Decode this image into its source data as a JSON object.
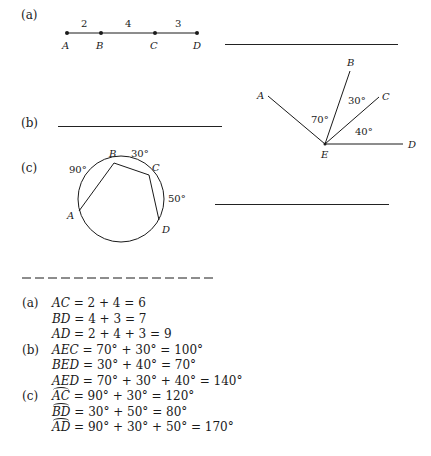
{
  "problems": {
    "a": {
      "label": "(a)",
      "points": [
        "A",
        "B",
        "C",
        "D"
      ],
      "segments": [
        "2",
        "4",
        "3"
      ]
    },
    "b": {
      "label": "(b)",
      "points": [
        "A",
        "B",
        "C",
        "D",
        "E"
      ],
      "angles": [
        "70°",
        "30°",
        "40°"
      ]
    },
    "c": {
      "label": "(c)",
      "points": [
        "A",
        "B",
        "C",
        "D"
      ],
      "arcs": [
        "90°",
        "30°",
        "50°"
      ]
    }
  },
  "answers": {
    "a": {
      "label": "(a)",
      "lines": [
        {
          "lhs": "AC",
          "rhs": " = 2 + 4 = 6"
        },
        {
          "lhs": "BD",
          "rhs": " = 4 + 3 = 7"
        },
        {
          "lhs": "AD",
          "rhs": " = 2 + 4 + 3 = 9"
        }
      ]
    },
    "b": {
      "label": "(b)",
      "lines": [
        {
          "lhs": "AEC",
          "rhs": " = 70° + 30° = 100°"
        },
        {
          "lhs": "BED",
          "rhs": " = 30° + 40° = 70°"
        },
        {
          "lhs": "AED",
          "rhs": " = 70° + 30° + 40° = 140°"
        }
      ]
    },
    "c": {
      "label": "(c)",
      "lines": [
        {
          "lhs": "AC",
          "rhs": " = 90° + 30° = 120°"
        },
        {
          "lhs": "BD",
          "rhs": " = 30° + 50° = 80°"
        },
        {
          "lhs": "AD",
          "rhs": " = 90° + 30° + 50° = 170°"
        }
      ]
    }
  }
}
